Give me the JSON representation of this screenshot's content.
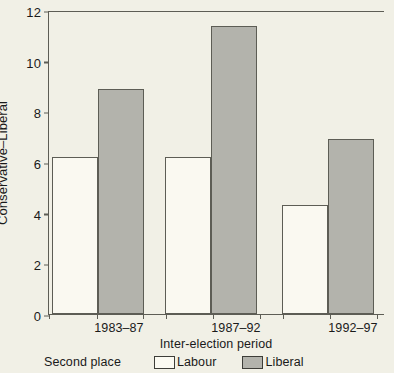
{
  "chart_data": {
    "type": "bar",
    "title": "",
    "xlabel": "Inter-election period",
    "ylabel": "Conservative–Liberal",
    "categories": [
      "1983–87",
      "1987–92",
      "1992–97"
    ],
    "series": [
      {
        "name": "Labour",
        "values": [
          6.2,
          6.2,
          4.3
        ],
        "color": "#faf9f1"
      },
      {
        "name": "Liberal",
        "values": [
          8.9,
          11.35,
          6.9
        ],
        "color": "#b3b3ac"
      }
    ],
    "ylim": [
      0,
      12
    ],
    "yticks": [
      0,
      2,
      4,
      6,
      8,
      10,
      12
    ],
    "ytick_labels": [
      "0",
      "2",
      "4",
      "6",
      "8",
      "10",
      "12"
    ],
    "grid": false,
    "legend_position": "bottom",
    "legend_title": "Second place"
  },
  "axes": {
    "y_label": "Conservative–Liberal",
    "x_label": "Inter-election period",
    "y_ticks": [
      "0",
      "2",
      "4",
      "6",
      "8",
      "10",
      "12"
    ],
    "x_ticks": [
      "1983–87",
      "1987–92",
      "1992–97"
    ]
  },
  "legend": {
    "title": "Second place",
    "items": [
      {
        "label": "Labour"
      },
      {
        "label": "Liberal"
      }
    ]
  },
  "colors": {
    "background": "#f1f0e6",
    "axis": "#5d5d55",
    "labour_fill": "#faf9f1",
    "liberal_fill": "#b3b3ac",
    "text": "#1a1a1a"
  }
}
